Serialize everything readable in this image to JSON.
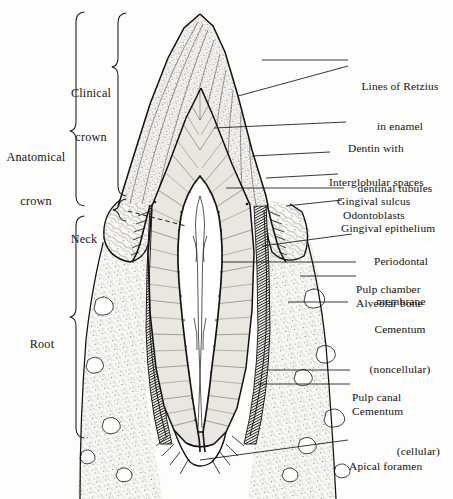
{
  "figure": {
    "style": "engraved line drawing, black ink on off-white"
  },
  "bracket_labels": [
    {
      "id": "clinical-crown",
      "line1": "Clinical",
      "line2": "crown",
      "text": "Clinical crown"
    },
    {
      "id": "anatomical-crown",
      "line1": "Anatomical",
      "line2": "crown",
      "text": "Anatomical crown"
    },
    {
      "id": "neck",
      "line1": "Neck",
      "line2": "",
      "text": "Neck"
    },
    {
      "id": "root",
      "line1": "Root",
      "line2": "",
      "text": "Root"
    }
  ],
  "callouts": [
    {
      "id": "lines-of-retzius",
      "line1": "Lines of Retzius",
      "line2": "in enamel"
    },
    {
      "id": "dentin",
      "line1": "Dentin with",
      "line2": "dentinal tubules"
    },
    {
      "id": "interglobular-spaces",
      "line1": "Interglobular spaces",
      "line2": ""
    },
    {
      "id": "gingival-sulcus",
      "line1": "Gingival sulcus",
      "line2": ""
    },
    {
      "id": "odontoblasts",
      "line1": "Odontoblasts",
      "line2": ""
    },
    {
      "id": "gingival-epithelium",
      "line1": "Gingival epithelium",
      "line2": ""
    },
    {
      "id": "periodontal-membrane",
      "line1": "Periodontal",
      "line2": "membrane"
    },
    {
      "id": "pulp-chamber",
      "line1": "Pulp chamber",
      "line2": ""
    },
    {
      "id": "alveolar-bone",
      "line1": "Alveolar bone",
      "line2": ""
    },
    {
      "id": "cementum-noncellular",
      "line1": "Cementum",
      "line2": "(noncellular)"
    },
    {
      "id": "pulp-canal",
      "line1": "Pulp canal",
      "line2": ""
    },
    {
      "id": "cementum-cellular",
      "line1": "Cementum",
      "line2": "(cellular)"
    },
    {
      "id": "apical-foramen",
      "line1": "Apical foramen",
      "line2": ""
    }
  ],
  "colors": {
    "ink": "#111111",
    "paper": "#fdfdfb",
    "enamel_fill": "#f2f0ec",
    "dentin_fill": "#e9e6e0",
    "pulp_fill": "#ffffff",
    "bone_fill": "#f7f6f2"
  }
}
